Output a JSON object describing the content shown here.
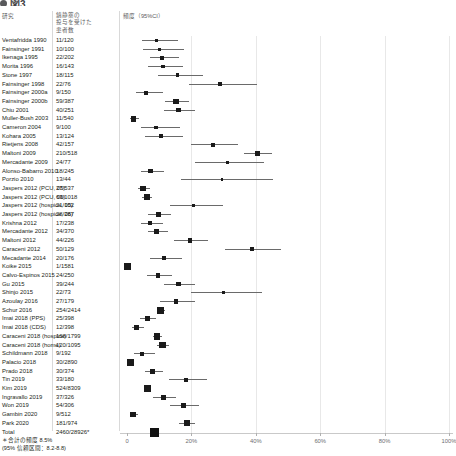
{
  "title": {
    "bullet": "bullet-icon",
    "text": "図3"
  },
  "headers": {
    "study": "研究",
    "count": "鎮静薬の\n投与を受けた\n患者数",
    "frequency": "頻度（95%CI）"
  },
  "footnote": "＊合計の頻度 8.5%\n   (95% 信頼区間：8.2-8.8)",
  "axis": {
    "ticks": [
      0,
      20,
      40,
      60,
      80,
      100
    ],
    "tick_labels": [
      "0",
      "20%",
      "40%",
      "60%",
      "80%",
      "100%"
    ],
    "xmin": 0,
    "xmax": 100
  },
  "colors": {
    "marker": "#1a1a1a",
    "ci_line": "#6a6a6a",
    "gridline": "#e8e8e8",
    "header_text": "#58595b",
    "body_text": "#231f20"
  },
  "chart_data": {
    "type": "forest",
    "title": "図3",
    "xlabel": "",
    "ylabel": "",
    "xlim": [
      0,
      100
    ],
    "grid": true,
    "legend": "none",
    "columns": [
      "研究",
      "鎮静薬の投与を受けた患者数",
      "頻度（95%CI）"
    ],
    "rows": [
      {
        "study": "Ventafridda 1990",
        "count": "11/120",
        "events": 11,
        "total": 120,
        "estimate": 9.2,
        "ci_low": 4.7,
        "ci_high": 15.8,
        "weight": 1.2
      },
      {
        "study": "Fainsinger 1991",
        "count": "10/100",
        "events": 10,
        "total": 100,
        "estimate": 10.0,
        "ci_low": 4.9,
        "ci_high": 17.6,
        "weight": 1.0
      },
      {
        "study": "Ikenaga 1995",
        "count": "22/202",
        "events": 22,
        "total": 202,
        "estimate": 10.9,
        "ci_low": 7.0,
        "ci_high": 16.0,
        "weight": 1.6
      },
      {
        "study": "Morita 1996",
        "count": "16/143",
        "events": 16,
        "total": 143,
        "estimate": 11.2,
        "ci_low": 6.5,
        "ci_high": 17.5,
        "weight": 1.3
      },
      {
        "study": "Stone 1997",
        "count": "18/115",
        "events": 18,
        "total": 115,
        "estimate": 15.7,
        "ci_low": 9.5,
        "ci_high": 23.6,
        "weight": 1.2
      },
      {
        "study": "Fainsinger 1998",
        "count": "22/76",
        "events": 22,
        "total": 76,
        "estimate": 28.9,
        "ci_low": 19.1,
        "ci_high": 40.5,
        "weight": 0.9
      },
      {
        "study": "Fainsinger 2000a",
        "count": "9/150",
        "events": 9,
        "total": 150,
        "estimate": 6.0,
        "ci_low": 2.8,
        "ci_high": 11.1,
        "weight": 1.3
      },
      {
        "study": "Fainsinger 2000b",
        "count": "59/387",
        "events": 59,
        "total": 387,
        "estimate": 15.2,
        "ci_low": 11.8,
        "ci_high": 19.2,
        "weight": 2.1
      },
      {
        "study": "Chiu 2001",
        "count": "40/251",
        "events": 40,
        "total": 251,
        "estimate": 15.9,
        "ci_low": 11.6,
        "ci_high": 21.1,
        "weight": 1.8
      },
      {
        "study": "Muller-Bush 2003",
        "count": "11/540",
        "events": 11,
        "total": 540,
        "estimate": 2.0,
        "ci_low": 1.0,
        "ci_high": 3.6,
        "weight": 2.3
      },
      {
        "study": "Cameron 2004",
        "count": "9/100",
        "events": 9,
        "total": 100,
        "estimate": 9.0,
        "ci_low": 4.2,
        "ci_high": 16.4,
        "weight": 1.0
      },
      {
        "study": "Kohara 2005",
        "count": "13/124",
        "events": 13,
        "total": 124,
        "estimate": 10.5,
        "ci_low": 5.7,
        "ci_high": 17.3,
        "weight": 1.2
      },
      {
        "study": "Rietjens 2008",
        "count": "42/157",
        "events": 42,
        "total": 157,
        "estimate": 26.8,
        "ci_low": 20.0,
        "ci_high": 34.4,
        "weight": 1.4
      },
      {
        "study": "Maltoni 2009",
        "count": "210/518",
        "events": 210,
        "total": 518,
        "estimate": 40.5,
        "ci_low": 36.3,
        "ci_high": 44.9,
        "weight": 2.3
      },
      {
        "study": "Mercadante 2009",
        "count": "24/77",
        "events": 24,
        "total": 77,
        "estimate": 31.2,
        "ci_low": 21.1,
        "ci_high": 42.7,
        "weight": 0.9
      },
      {
        "study": "Alonso-Babarro 2010",
        "count": "18/245",
        "events": 18,
        "total": 245,
        "estimate": 7.3,
        "ci_low": 4.4,
        "ci_high": 11.4,
        "weight": 1.8
      },
      {
        "study": "Porzio 2010",
        "count": "13/44",
        "events": 13,
        "total": 44,
        "estimate": 29.5,
        "ci_low": 16.8,
        "ci_high": 45.2,
        "weight": 0.6
      },
      {
        "study": "Jaspers 2012 (PCU, 05)",
        "count": "27/537",
        "events": 27,
        "total": 537,
        "estimate": 5.0,
        "ci_low": 3.3,
        "ci_high": 7.2,
        "weight": 2.3
      },
      {
        "study": "Jaspers 2012 (PCU, 06)",
        "count": "63/1018",
        "events": 63,
        "total": 1018,
        "estimate": 6.2,
        "ci_low": 4.8,
        "ci_high": 7.9,
        "weight": 2.7
      },
      {
        "study": "Jaspers 2012 (hospice, 05)",
        "count": "21/102",
        "events": 21,
        "total": 102,
        "estimate": 20.6,
        "ci_low": 13.2,
        "ci_high": 29.7,
        "weight": 1.0
      },
      {
        "study": "Jaspers 2012 (hospice, 06)",
        "count": "28/287",
        "events": 28,
        "total": 287,
        "estimate": 9.8,
        "ci_low": 6.6,
        "ci_high": 13.8,
        "weight": 1.9
      },
      {
        "study": "Krishna 2012",
        "count": "17/238",
        "events": 17,
        "total": 238,
        "estimate": 7.1,
        "ci_low": 4.2,
        "ci_high": 11.2,
        "weight": 1.7
      },
      {
        "study": "Mercadante 2012",
        "count": "34/370",
        "events": 34,
        "total": 370,
        "estimate": 9.2,
        "ci_low": 6.4,
        "ci_high": 12.6,
        "weight": 2.0
      },
      {
        "study": "Maltoni 2012",
        "count": "44/226",
        "events": 44,
        "total": 226,
        "estimate": 19.5,
        "ci_low": 14.5,
        "ci_high": 25.2,
        "weight": 1.7
      },
      {
        "study": "Caraceni 2012",
        "count": "50/129",
        "events": 50,
        "total": 129,
        "estimate": 38.8,
        "ci_low": 30.3,
        "ci_high": 47.7,
        "weight": 1.2
      },
      {
        "study": "Mecadante 2014",
        "count": "20/176",
        "events": 20,
        "total": 176,
        "estimate": 11.4,
        "ci_low": 7.1,
        "ci_high": 17.0,
        "weight": 1.5
      },
      {
        "study": "Koike 2015",
        "count": "1/1581",
        "events": 1,
        "total": 1581,
        "estimate": 0.1,
        "ci_low": 0.0,
        "ci_high": 0.4,
        "weight": 3.0
      },
      {
        "study": "Calvo-Espinos 2015",
        "count": "24/250",
        "events": 24,
        "total": 250,
        "estimate": 9.6,
        "ci_low": 6.3,
        "ci_high": 14.0,
        "weight": 1.8
      },
      {
        "study": "Gu 2015",
        "count": "39/244",
        "events": 39,
        "total": 244,
        "estimate": 16.0,
        "ci_low": 11.6,
        "ci_high": 21.2,
        "weight": 1.7
      },
      {
        "study": "Shinjo 2015",
        "count": "22/73",
        "events": 22,
        "total": 73,
        "estimate": 30.1,
        "ci_low": 19.9,
        "ci_high": 42.0,
        "weight": 0.9
      },
      {
        "study": "Azoulay 2016",
        "count": "27/179",
        "events": 27,
        "total": 179,
        "estimate": 15.1,
        "ci_low": 10.2,
        "ci_high": 21.1,
        "weight": 1.5
      },
      {
        "study": "Schur 2016",
        "count": "254/2414",
        "events": 254,
        "total": 2414,
        "estimate": 10.5,
        "ci_low": 9.3,
        "ci_high": 11.8,
        "weight": 3.0
      },
      {
        "study": "Imai 2018 (PPS)",
        "count": "25/398",
        "events": 25,
        "total": 398,
        "estimate": 6.3,
        "ci_low": 4.1,
        "ci_high": 9.1,
        "weight": 2.1
      },
      {
        "study": "Imai 2018 (CDS)",
        "count": "12/398",
        "events": 12,
        "total": 398,
        "estimate": 3.0,
        "ci_low": 1.6,
        "ci_high": 5.2,
        "weight": 2.1
      },
      {
        "study": "Caraceni 2018 (hospice)",
        "count": "168/1799",
        "events": 168,
        "total": 1799,
        "estimate": 9.3,
        "ci_low": 8.0,
        "ci_high": 10.8,
        "weight": 2.9
      },
      {
        "study": "Caraceni 2018 (home)",
        "count": "120/1095",
        "events": 120,
        "total": 1095,
        "estimate": 11.0,
        "ci_low": 9.2,
        "ci_high": 13.0,
        "weight": 2.7
      },
      {
        "study": "Schildmann 2018",
        "count": "9/192",
        "events": 9,
        "total": 192,
        "estimate": 4.7,
        "ci_low": 2.2,
        "ci_high": 8.7,
        "weight": 1.6
      },
      {
        "study": "Palacio 2018",
        "count": "30/2890",
        "events": 30,
        "total": 2890,
        "estimate": 1.0,
        "ci_low": 0.7,
        "ci_high": 1.5,
        "weight": 3.1
      },
      {
        "study": "Prado 2018",
        "count": "30/374",
        "events": 30,
        "total": 374,
        "estimate": 8.0,
        "ci_low": 5.5,
        "ci_high": 11.3,
        "weight": 2.0
      },
      {
        "study": "Tin 2019",
        "count": "33/180",
        "events": 33,
        "total": 180,
        "estimate": 18.3,
        "ci_low": 13.0,
        "ci_high": 24.7,
        "weight": 1.5
      },
      {
        "study": "Kim 2019",
        "count": "524/8309",
        "events": 524,
        "total": 8309,
        "estimate": 6.3,
        "ci_low": 5.8,
        "ci_high": 6.9,
        "weight": 3.3
      },
      {
        "study": "Ingravallo 2019",
        "count": "37/326",
        "events": 37,
        "total": 326,
        "estimate": 11.3,
        "ci_low": 8.1,
        "ci_high": 15.3,
        "weight": 1.9
      },
      {
        "study": "Won 2019",
        "count": "54/306",
        "events": 54,
        "total": 306,
        "estimate": 17.6,
        "ci_low": 13.5,
        "ci_high": 22.4,
        "weight": 1.9
      },
      {
        "study": "Gambin 2020",
        "count": "9/512",
        "events": 9,
        "total": 512,
        "estimate": 1.8,
        "ci_low": 0.8,
        "ci_high": 3.3,
        "weight": 2.3
      },
      {
        "study": "Park 2020",
        "count": "181/974",
        "events": 181,
        "total": 974,
        "estimate": 18.6,
        "ci_low": 16.2,
        "ci_high": 21.2,
        "weight": 2.6
      },
      {
        "study": "Total",
        "count": "2460/28926*",
        "events": 2460,
        "total": 28926,
        "estimate": 8.5,
        "ci_low": 8.2,
        "ci_high": 8.8,
        "weight": 0,
        "is_total": true
      }
    ],
    "pooled": {
      "label": "Total",
      "count": "2460/28926*",
      "estimate": 8.5,
      "ci_low": 8.2,
      "ci_high": 8.8
    }
  }
}
